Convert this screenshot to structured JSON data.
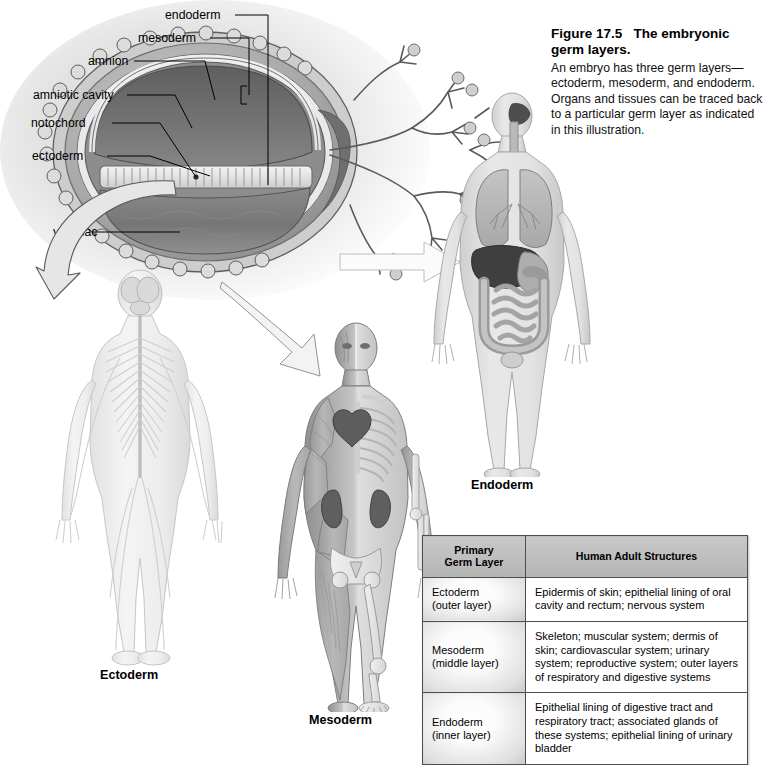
{
  "figure": {
    "number": "Figure 17.5",
    "title": "The embryonic germ layers.",
    "description": "An embryo has three germ layers—ectoderm, mesoderm, and endoderm. Organs and tissues can be traced back to a particular germ layer as indicated in this illustration."
  },
  "embryo_labels": [
    {
      "id": "endoderm",
      "text": "endoderm"
    },
    {
      "id": "mesoderm",
      "text": "mesoderm"
    },
    {
      "id": "amnion",
      "text": "amnion"
    },
    {
      "id": "amniotic-cavity",
      "text": "amniotic cavity"
    },
    {
      "id": "notochord",
      "text": "notochord"
    },
    {
      "id": "ectoderm",
      "text": "ectoderm"
    },
    {
      "id": "yolk-sac",
      "text": "yolk sac"
    }
  ],
  "body_figures": [
    {
      "id": "ectoderm",
      "label": "Ectoderm",
      "depicts": "nervous system, posterior view"
    },
    {
      "id": "mesoderm",
      "label": "Mesoderm",
      "depicts": "muscular and skeletal systems with heart and kidneys"
    },
    {
      "id": "endoderm",
      "label": "Endoderm",
      "depicts": "digestive and respiratory tract organs"
    }
  ],
  "table": {
    "headers": [
      "Primary\nGerm Layer",
      "Human Adult Structures"
    ],
    "header_col1_line1": "Primary",
    "header_col1_line2": "Germ Layer",
    "header_col2": "Human Adult Structures",
    "rows": [
      {
        "layer": "Ectoderm",
        "layer_sub": "(outer layer)",
        "structures": "Epidermis of skin; epithelial lining of oral cavity and rectum; nervous system"
      },
      {
        "layer": "Mesoderm",
        "layer_sub": "(middle layer)",
        "structures": "Skeleton; muscular system; dermis of skin; cardiovascular system; urinary system; reproductive system; outer layers of respiratory and digestive systems"
      },
      {
        "layer": "Endoderm",
        "layer_sub": "(inner layer)",
        "structures": "Epithelial lining of digestive tract and respiratory tract; associated glands of these systems; epithelial lining of urinary bladder"
      }
    ]
  },
  "colors": {
    "table_header_bg": "#bdbdbd",
    "table_border": "#4d4d4d",
    "text": "#000000",
    "page_bg": "#ffffff",
    "amniotic_cavity": "#6f6f6f",
    "yolk_sac": "#7a7a7a",
    "chorion": "#9a9a9a"
  }
}
